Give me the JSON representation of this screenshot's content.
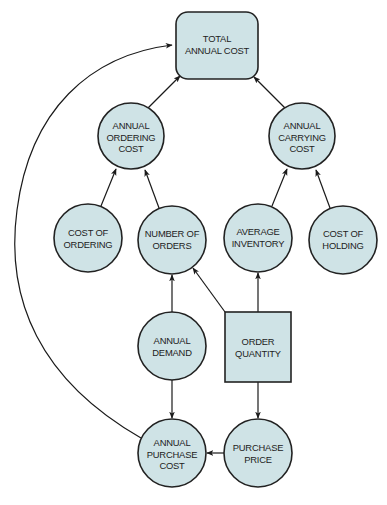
{
  "diagram": {
    "type": "influence-diagram",
    "colors": {
      "node_fill": "#cfe3e6",
      "node_stroke": "#222222",
      "edge": "#1a1a1a"
    },
    "nodes": [
      {
        "id": "total_annual_cost",
        "shape": "rounded-rect",
        "lines": [
          "TOTAL",
          "ANNUAL COST"
        ]
      },
      {
        "id": "annual_ordering_cost",
        "shape": "circle",
        "lines": [
          "ANNUAL",
          "ORDERING",
          "COST"
        ]
      },
      {
        "id": "annual_carrying_cost",
        "shape": "circle",
        "lines": [
          "ANNUAL",
          "CARRYING",
          "COST"
        ]
      },
      {
        "id": "cost_of_ordering",
        "shape": "circle",
        "lines": [
          "COST OF",
          "ORDERING"
        ]
      },
      {
        "id": "number_of_orders",
        "shape": "circle",
        "lines": [
          "NUMBER OF",
          "ORDERS"
        ]
      },
      {
        "id": "average_inventory",
        "shape": "circle",
        "lines": [
          "AVERAGE",
          "INVENTORY"
        ]
      },
      {
        "id": "cost_of_holding",
        "shape": "circle",
        "lines": [
          "COST OF",
          "HOLDING"
        ]
      },
      {
        "id": "annual_demand",
        "shape": "circle",
        "lines": [
          "ANNUAL",
          "DEMAND"
        ]
      },
      {
        "id": "order_quantity",
        "shape": "square",
        "lines": [
          "ORDER",
          "QUANTITY"
        ]
      },
      {
        "id": "annual_purchase_cost",
        "shape": "circle",
        "lines": [
          "ANNUAL",
          "PURCHASE",
          "COST"
        ]
      },
      {
        "id": "purchase_price",
        "shape": "circle",
        "lines": [
          "PURCHASE",
          "PRICE"
        ]
      }
    ],
    "edges": [
      {
        "from": "annual_ordering_cost",
        "to": "total_annual_cost"
      },
      {
        "from": "annual_carrying_cost",
        "to": "total_annual_cost"
      },
      {
        "from": "annual_purchase_cost",
        "to": "total_annual_cost"
      },
      {
        "from": "cost_of_ordering",
        "to": "annual_ordering_cost"
      },
      {
        "from": "number_of_orders",
        "to": "annual_ordering_cost"
      },
      {
        "from": "average_inventory",
        "to": "annual_carrying_cost"
      },
      {
        "from": "cost_of_holding",
        "to": "annual_carrying_cost"
      },
      {
        "from": "annual_demand",
        "to": "number_of_orders"
      },
      {
        "from": "order_quantity",
        "to": "number_of_orders"
      },
      {
        "from": "order_quantity",
        "to": "average_inventory"
      },
      {
        "from": "annual_demand",
        "to": "annual_purchase_cost"
      },
      {
        "from": "order_quantity",
        "to": "purchase_price"
      },
      {
        "from": "purchase_price",
        "to": "annual_purchase_cost"
      }
    ]
  }
}
